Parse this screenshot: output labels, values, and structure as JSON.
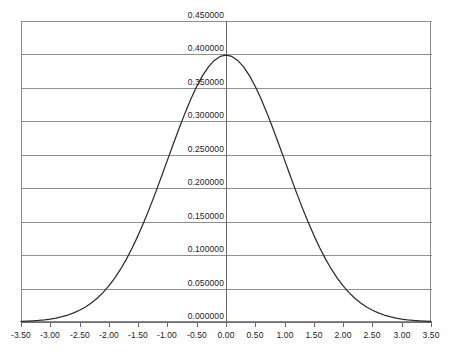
{
  "chart_data": {
    "type": "line",
    "title": "",
    "xlabel": "",
    "ylabel": "",
    "xlim": [
      -3.5,
      3.5
    ],
    "ylim": [
      0.0,
      0.45
    ],
    "grid": true,
    "legend": null,
    "legend_position": "none",
    "x_ticks": [
      "-3.50",
      "-3.00",
      "-2.50",
      "-2.00",
      "-1.50",
      "-1.00",
      "-0.50",
      "0.00",
      "0.50",
      "1.00",
      "1.50",
      "2.00",
      "2.50",
      "3.00",
      "3.50"
    ],
    "x_tick_values": [
      -3.5,
      -3.0,
      -2.5,
      -2.0,
      -1.5,
      -1.0,
      -0.5,
      0.0,
      0.5,
      1.0,
      1.5,
      2.0,
      2.5,
      3.0,
      3.5
    ],
    "y_ticks": [
      "0.450000",
      "0.400000",
      "0.350000",
      "0.300000",
      "0.250000",
      "0.200000",
      "0.150000",
      "0.100000",
      "0.050000",
      "0.000000"
    ],
    "y_tick_values": [
      0.45,
      0.4,
      0.35,
      0.3,
      0.25,
      0.2,
      0.15,
      0.1,
      0.05,
      0.0
    ],
    "series": [
      {
        "name": "standard normal pdf",
        "color": "#2b2b2b",
        "x": [
          -3.5,
          -3.4,
          -3.3,
          -3.2,
          -3.1,
          -3.0,
          -2.9,
          -2.8,
          -2.7,
          -2.6,
          -2.5,
          -2.4,
          -2.3,
          -2.2,
          -2.1,
          -2.0,
          -1.9,
          -1.8,
          -1.7,
          -1.6,
          -1.5,
          -1.4,
          -1.3,
          -1.2,
          -1.1,
          -1.0,
          -0.9,
          -0.8,
          -0.7,
          -0.6,
          -0.5,
          -0.4,
          -0.3,
          -0.2,
          -0.1,
          0.0,
          0.1,
          0.2,
          0.3,
          0.4,
          0.5,
          0.6,
          0.7,
          0.8,
          0.9,
          1.0,
          1.1,
          1.2,
          1.3,
          1.4,
          1.5,
          1.6,
          1.7,
          1.8,
          1.9,
          2.0,
          2.1,
          2.2,
          2.3,
          2.4,
          2.5,
          2.6,
          2.7,
          2.8,
          2.9,
          3.0,
          3.1,
          3.2,
          3.3,
          3.4,
          3.5
        ],
        "y": [
          0.000873,
          0.001232,
          0.001723,
          0.002384,
          0.003267,
          0.004432,
          0.005953,
          0.007915,
          0.010421,
          0.013583,
          0.017528,
          0.022395,
          0.028327,
          0.035475,
          0.043984,
          0.053991,
          0.065616,
          0.07895,
          0.094049,
          0.110921,
          0.129518,
          0.149727,
          0.171369,
          0.194186,
          0.217852,
          0.241971,
          0.266085,
          0.289692,
          0.312254,
          0.333225,
          0.352065,
          0.36827,
          0.381388,
          0.391043,
          0.396953,
          0.398942,
          0.396953,
          0.391043,
          0.381388,
          0.36827,
          0.352065,
          0.333225,
          0.312254,
          0.289692,
          0.266085,
          0.241971,
          0.217852,
          0.194186,
          0.171369,
          0.149727,
          0.129518,
          0.110921,
          0.094049,
          0.07895,
          0.065616,
          0.053991,
          0.043984,
          0.035475,
          0.028327,
          0.022395,
          0.017528,
          0.013583,
          0.010421,
          0.007915,
          0.005953,
          0.004432,
          0.003267,
          0.002384,
          0.001723,
          0.001232,
          0.000873
        ]
      }
    ],
    "annotations": [],
    "peak": {
      "x": 0.0,
      "y": 0.398942
    },
    "colors": {
      "curve": "#2b2b2b",
      "grid": "#8f8f8f",
      "axis": "#6a6a6a",
      "background": "#ffffff",
      "text": "#1a1a1a"
    }
  }
}
